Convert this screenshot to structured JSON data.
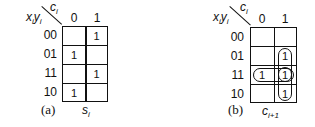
{
  "maps": [
    {
      "id": "a",
      "caption": "(a)",
      "function_name": "s",
      "function_sub": "i",
      "col_var": "c",
      "col_var_sub": "i",
      "row_var_x": "x",
      "row_var_x_sub": "i",
      "row_var_y": "y",
      "row_var_y_sub": "i",
      "col_labels": [
        "0",
        "1"
      ],
      "row_labels": [
        "00",
        "01",
        "11",
        "10"
      ],
      "cells": [
        [
          "",
          "1"
        ],
        [
          "1",
          ""
        ],
        [
          "",
          "1"
        ],
        [
          "1",
          ""
        ]
      ]
    },
    {
      "id": "b",
      "caption": "(b)",
      "function_name": "c",
      "function_sub": "i+1",
      "col_var": "c",
      "col_var_sub": "i",
      "row_var_x": "x",
      "row_var_x_sub": "i",
      "row_var_y": "y",
      "row_var_y_sub": "i",
      "col_labels": [
        "0",
        "1"
      ],
      "row_labels": [
        "00",
        "01",
        "11",
        "10"
      ],
      "cells": [
        [
          "",
          ""
        ],
        [
          "",
          "1"
        ],
        [
          "1",
          "1"
        ],
        [
          "",
          "1"
        ]
      ],
      "groupings": [
        {
          "cells": [
            [
              1,
              1
            ],
            [
              2,
              1
            ]
          ],
          "shape": "vertical-loop"
        },
        {
          "cells": [
            [
              2,
              0
            ],
            [
              2,
              1
            ]
          ],
          "shape": "horizontal-loop"
        },
        {
          "cells": [
            [
              2,
              1
            ],
            [
              3,
              1
            ]
          ],
          "shape": "vertical-loop"
        }
      ]
    }
  ],
  "cutoff_text": "x'i yi ci + xi y'i c'i ... xi ⊕ yi ⊕ ci"
}
